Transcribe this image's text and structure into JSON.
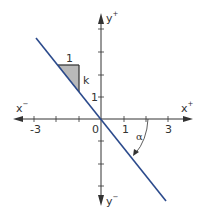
{
  "diagram": {
    "title": "",
    "colors": {
      "axis": "#333333",
      "line": "#2b4a8c",
      "triangle_fill": "#b9b9b9",
      "text": "#333333"
    },
    "axes": {
      "x_neg_label": "x",
      "x_neg_sup": "−",
      "x_pos_label": "x",
      "x_pos_sup": "+",
      "y_pos_label": "y",
      "y_pos_sup": "+",
      "y_neg_label": "y",
      "y_neg_sup": "−",
      "origin_label": "0",
      "x_tick_labels": [
        "-3",
        "1",
        "3"
      ],
      "y_tick_labels": [
        "1"
      ],
      "x_ticks": [
        -3,
        -2,
        -1,
        1,
        2,
        3
      ],
      "y_ticks": [
        4,
        3,
        2,
        1,
        -1,
        -2,
        -3
      ]
    },
    "line": {
      "description": "line through origin with negative slope",
      "slope_label": "k"
    },
    "slope_triangle": {
      "run_label": "1",
      "rise_label": "k"
    },
    "angle": {
      "label": "α"
    }
  }
}
